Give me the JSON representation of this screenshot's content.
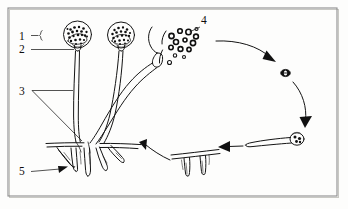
{
  "figure": {
    "background_color": "#fdfdfc",
    "ink_color": "#141414",
    "frame_color": "#8c8c8c",
    "width": 348,
    "height": 209
  },
  "labels": [
    {
      "id": "label-1",
      "text": "1",
      "x": 22,
      "y": 36,
      "leader": "short dash with brace pointing to sporangium wall"
    },
    {
      "id": "label-2",
      "text": "2",
      "x": 22,
      "y": 50,
      "leader": "horizontal line to sporangiophore apex"
    },
    {
      "id": "label-3",
      "text": "3",
      "x": 22,
      "y": 91,
      "leader": "wedge bracket spanning the stalk region"
    },
    {
      "id": "label-4",
      "text": "4",
      "x": 204,
      "y": 21,
      "leader": "diagonal line to released spores"
    },
    {
      "id": "label-5",
      "text": "5",
      "x": 22,
      "y": 171,
      "leader": "arrow pointing to rhizoid"
    }
  ],
  "structures": [
    {
      "name": "sporangium-intact-left",
      "label_refs": [
        "1",
        "2"
      ]
    },
    {
      "name": "sporangium-intact-middle",
      "label_refs": []
    },
    {
      "name": "sporangium-ruptured-right",
      "label_refs": [
        "4"
      ]
    },
    {
      "name": "sporangiophore-stalk",
      "label_refs": [
        "3"
      ]
    },
    {
      "name": "rhizoid-mycelium",
      "label_refs": [
        "5"
      ]
    },
    {
      "name": "released-spores",
      "label_refs": [
        "4"
      ]
    },
    {
      "name": "germinating-spore",
      "label_refs": []
    },
    {
      "name": "germ-tube-spore",
      "label_refs": []
    },
    {
      "name": "stolon-with-rhizoids",
      "label_refs": []
    }
  ],
  "cycle_arrows": [
    {
      "name": "arrow-spores-to-germinating",
      "direction": "right-down"
    },
    {
      "name": "arrow-germinating-to-germtube",
      "direction": "down"
    },
    {
      "name": "arrow-germtube-to-stolon",
      "direction": "left"
    },
    {
      "name": "arrow-stolon-to-mycelium",
      "direction": "left-up"
    }
  ]
}
